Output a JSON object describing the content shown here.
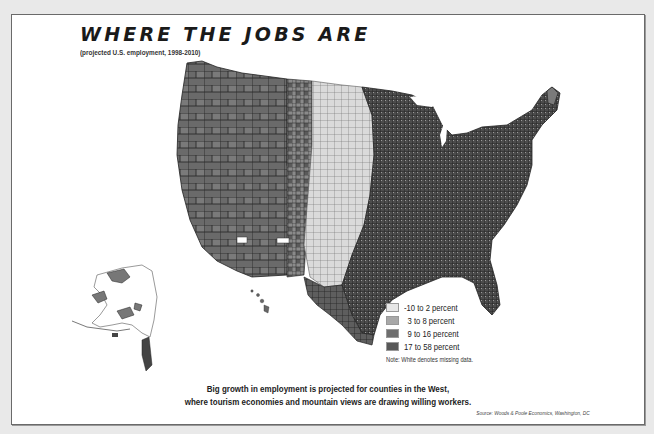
{
  "title": "WHERE THE JOBS ARE",
  "subtitle": "(projected U.S. employment, 1998-2010)",
  "legend": {
    "items": [
      {
        "label": "-10 to 2 percent",
        "color": "#e6e6e6"
      },
      {
        "label": "3 to 8 percent",
        "color": "#a8a8a8"
      },
      {
        "label": "9 to 16 percent",
        "color": "#6e6e6e"
      },
      {
        "label": "17 to 58 percent",
        "color": "#585858"
      }
    ],
    "note": "Note: White denotes missing data."
  },
  "caption": {
    "line1": "Big growth in employment is projected for counties in the West,",
    "line2": "where tourism economies and mountain views are drawing willing workers."
  },
  "source": "Source: Woods & Poole Economics, Washington, DC",
  "map": {
    "type": "choropleth",
    "region": "United States counties (incl. Alaska, Hawaii)",
    "variable": "Projected employment growth, 1998-2010",
    "regions_summary": [
      {
        "area": "West / Mountain / Pacific",
        "class": "9 to 16 / 17 to 58 percent"
      },
      {
        "area": "Great Plains",
        "class": "-10 to 2 percent"
      },
      {
        "area": "Midwest / Southeast",
        "class": "9 to 16 percent mixed"
      },
      {
        "area": "Northeast",
        "class": "3 to 16 percent mixed"
      }
    ]
  }
}
